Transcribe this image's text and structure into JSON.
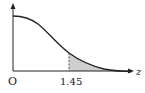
{
  "diagram": {
    "type": "normal-distribution-curve",
    "origin_label": "O",
    "x_axis_label": "z",
    "marked_value_label": "1.45",
    "shaded_region": "area under curve to the right of z = 1.45",
    "colors": {
      "curve": "#222222",
      "axes": "#222222",
      "shade": "#cfcfcf",
      "dashed_line": "#444444"
    }
  }
}
